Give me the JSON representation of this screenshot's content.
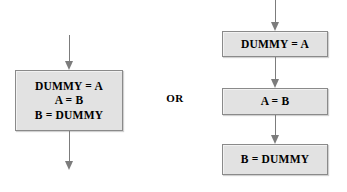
{
  "diagram": {
    "background_color": "#ffffff",
    "box_fill_color": "#e2e2e2",
    "box_border_color": "#8a8a8a",
    "arrow_color": "#7c7c7c",
    "text_color": "#000000",
    "connector": {
      "label": "OR"
    },
    "left_variant": {
      "name": "single-combined-box",
      "box": {
        "lines": [
          "DUMMY = A",
          "A = B",
          "B = DUMMY"
        ]
      },
      "arrows": [
        {
          "name": "inbound",
          "direction": "down"
        },
        {
          "name": "outbound",
          "direction": "down"
        }
      ]
    },
    "right_variant": {
      "name": "three-sequential-boxes",
      "boxes": [
        {
          "text": "DUMMY = A"
        },
        {
          "text": "A = B"
        },
        {
          "text": "B = DUMMY"
        }
      ],
      "arrows": [
        {
          "name": "inbound",
          "direction": "down"
        },
        {
          "name": "box1-to-box2",
          "direction": "down"
        },
        {
          "name": "box2-to-box3",
          "direction": "down"
        }
      ]
    }
  }
}
